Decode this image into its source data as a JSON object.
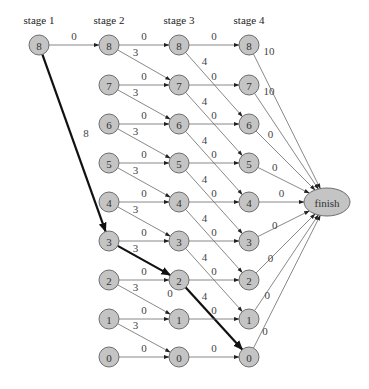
{
  "diagram": {
    "type": "dynamic-programming stage graph",
    "stages": [
      {
        "label": "stage 1",
        "x": 39
      },
      {
        "label": "stage 2",
        "x": 109
      },
      {
        "label": "stage 3",
        "x": 179
      },
      {
        "label": "stage 4",
        "x": 249
      }
    ],
    "row_y": {
      "8": 45,
      "7": 85,
      "6": 124,
      "5": 163,
      "4": 202,
      "3": 241,
      "2": 280,
      "1": 319,
      "0": 357
    },
    "node_radius": 10,
    "finish": {
      "label": "finish",
      "cx": 327,
      "cy": 202,
      "rx": 23,
      "ry": 14
    },
    "colors": {
      "node_fill": "#c4c4c4",
      "node_stroke": "#6e6e6e",
      "edge": "#6a6a6a",
      "bold_edge": "#111111"
    },
    "nodes": [
      {
        "stage": 1,
        "state": "8"
      },
      {
        "stage": 2,
        "state": "8"
      },
      {
        "stage": 2,
        "state": "7"
      },
      {
        "stage": 2,
        "state": "6"
      },
      {
        "stage": 2,
        "state": "5"
      },
      {
        "stage": 2,
        "state": "4"
      },
      {
        "stage": 2,
        "state": "3"
      },
      {
        "stage": 2,
        "state": "2"
      },
      {
        "stage": 2,
        "state": "1"
      },
      {
        "stage": 2,
        "state": "0"
      },
      {
        "stage": 3,
        "state": "8"
      },
      {
        "stage": 3,
        "state": "7"
      },
      {
        "stage": 3,
        "state": "6"
      },
      {
        "stage": 3,
        "state": "5"
      },
      {
        "stage": 3,
        "state": "4"
      },
      {
        "stage": 3,
        "state": "3"
      },
      {
        "stage": 3,
        "state": "2"
      },
      {
        "stage": 3,
        "state": "1"
      },
      {
        "stage": 3,
        "state": "0"
      },
      {
        "stage": 4,
        "state": "8"
      },
      {
        "stage": 4,
        "state": "7"
      },
      {
        "stage": 4,
        "state": "6"
      },
      {
        "stage": 4,
        "state": "5"
      },
      {
        "stage": 4,
        "state": "4"
      },
      {
        "stage": 4,
        "state": "3"
      },
      {
        "stage": 4,
        "state": "2"
      },
      {
        "stage": 4,
        "state": "1"
      },
      {
        "stage": 4,
        "state": "0"
      }
    ],
    "edges": [
      {
        "from": [
          1,
          "8"
        ],
        "to": [
          2,
          "8"
        ],
        "label": "0",
        "bold": false
      },
      {
        "from": [
          1,
          "8"
        ],
        "to": [
          2,
          "3"
        ],
        "label": "8",
        "bold": true
      },
      {
        "from": [
          2,
          "8"
        ],
        "to": [
          3,
          "8"
        ],
        "label": "0",
        "bold": false
      },
      {
        "from": [
          2,
          "8"
        ],
        "to": [
          3,
          "7"
        ],
        "label": "3",
        "bold": false
      },
      {
        "from": [
          2,
          "7"
        ],
        "to": [
          3,
          "7"
        ],
        "label": "0",
        "bold": false
      },
      {
        "from": [
          2,
          "7"
        ],
        "to": [
          3,
          "6"
        ],
        "label": "3",
        "bold": false
      },
      {
        "from": [
          2,
          "6"
        ],
        "to": [
          3,
          "6"
        ],
        "label": "0",
        "bold": false
      },
      {
        "from": [
          2,
          "6"
        ],
        "to": [
          3,
          "5"
        ],
        "label": "3",
        "bold": false
      },
      {
        "from": [
          2,
          "5"
        ],
        "to": [
          3,
          "5"
        ],
        "label": "0",
        "bold": false
      },
      {
        "from": [
          2,
          "5"
        ],
        "to": [
          3,
          "4"
        ],
        "label": "3",
        "bold": false
      },
      {
        "from": [
          2,
          "4"
        ],
        "to": [
          3,
          "4"
        ],
        "label": "0",
        "bold": false
      },
      {
        "from": [
          2,
          "4"
        ],
        "to": [
          3,
          "3"
        ],
        "label": "3",
        "bold": false
      },
      {
        "from": [
          2,
          "3"
        ],
        "to": [
          3,
          "3"
        ],
        "label": "0",
        "bold": false
      },
      {
        "from": [
          2,
          "3"
        ],
        "to": [
          3,
          "2"
        ],
        "label": "3",
        "bold": true
      },
      {
        "from": [
          2,
          "2"
        ],
        "to": [
          3,
          "2"
        ],
        "label": "0",
        "bold": false
      },
      {
        "from": [
          2,
          "2"
        ],
        "to": [
          3,
          "1"
        ],
        "label": "3",
        "bold": false
      },
      {
        "from": [
          2,
          "1"
        ],
        "to": [
          3,
          "1"
        ],
        "label": "0",
        "bold": false
      },
      {
        "from": [
          2,
          "1"
        ],
        "to": [
          3,
          "0"
        ],
        "label": "3",
        "bold": false
      },
      {
        "from": [
          2,
          "0"
        ],
        "to": [
          3,
          "0"
        ],
        "label": "0",
        "bold": false
      },
      {
        "from": [
          3,
          "8"
        ],
        "to": [
          4,
          "8"
        ],
        "label": "0",
        "bold": false
      },
      {
        "from": [
          3,
          "8"
        ],
        "to": [
          4,
          "6"
        ],
        "label": "4",
        "bold": false
      },
      {
        "from": [
          3,
          "7"
        ],
        "to": [
          4,
          "7"
        ],
        "label": "0",
        "bold": false
      },
      {
        "from": [
          3,
          "7"
        ],
        "to": [
          4,
          "5"
        ],
        "label": "4",
        "bold": false
      },
      {
        "from": [
          3,
          "6"
        ],
        "to": [
          4,
          "6"
        ],
        "label": "0",
        "bold": false
      },
      {
        "from": [
          3,
          "6"
        ],
        "to": [
          4,
          "4"
        ],
        "label": "4",
        "bold": false
      },
      {
        "from": [
          3,
          "5"
        ],
        "to": [
          4,
          "5"
        ],
        "label": "0",
        "bold": false
      },
      {
        "from": [
          3,
          "5"
        ],
        "to": [
          4,
          "3"
        ],
        "label": "4",
        "bold": false
      },
      {
        "from": [
          3,
          "4"
        ],
        "to": [
          4,
          "4"
        ],
        "label": "0",
        "bold": false
      },
      {
        "from": [
          3,
          "4"
        ],
        "to": [
          4,
          "2"
        ],
        "label": "4",
        "bold": false
      },
      {
        "from": [
          3,
          "3"
        ],
        "to": [
          4,
          "3"
        ],
        "label": "0",
        "bold": false
      },
      {
        "from": [
          3,
          "3"
        ],
        "to": [
          4,
          "1"
        ],
        "label": "4",
        "bold": false
      },
      {
        "from": [
          3,
          "2"
        ],
        "to": [
          4,
          "2"
        ],
        "label": "0",
        "bold": false
      },
      {
        "from": [
          3,
          "2"
        ],
        "to": [
          4,
          "0"
        ],
        "label": "4",
        "bold": true
      },
      {
        "from": [
          3,
          "1"
        ],
        "to": [
          4,
          "1"
        ],
        "label": "0",
        "bold": false
      },
      {
        "from": [
          3,
          "0"
        ],
        "to": [
          4,
          "0"
        ],
        "label": "0",
        "bold": false
      },
      {
        "from": [
          4,
          "8"
        ],
        "to": "finish",
        "label": "10",
        "bold": false
      },
      {
        "from": [
          4,
          "7"
        ],
        "to": "finish",
        "label": "10",
        "bold": false
      },
      {
        "from": [
          4,
          "6"
        ],
        "to": "finish",
        "label": "0",
        "bold": false
      },
      {
        "from": [
          4,
          "5"
        ],
        "to": "finish",
        "label": "0",
        "bold": false
      },
      {
        "from": [
          4,
          "4"
        ],
        "to": "finish",
        "label": "0",
        "bold": false
      },
      {
        "from": [
          4,
          "3"
        ],
        "to": "finish",
        "label": "0",
        "bold": false
      },
      {
        "from": [
          4,
          "2"
        ],
        "to": "finish",
        "label": "0",
        "bold": false
      },
      {
        "from": [
          4,
          "1"
        ],
        "to": "finish",
        "label": "0",
        "bold": false
      },
      {
        "from": [
          4,
          "0"
        ],
        "to": "finish",
        "label": "0",
        "bold": false
      }
    ],
    "extra_labels": [
      {
        "text": "0",
        "x": 170,
        "y": 297,
        "note": "label below stage-3 node 2"
      }
    ]
  }
}
